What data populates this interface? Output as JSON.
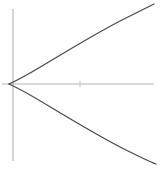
{
  "figure": {
    "title": "",
    "background_color": "#fefefe",
    "width": 160,
    "height": 172
  },
  "axes": {
    "axis_color": "#b3b3b3",
    "tick_color": "#c2c2c2",
    "x_axis": {
      "name": "x-axis",
      "y_pixel": 84,
      "x_start_pixel": 2,
      "x_end_pixel": 154,
      "label": ""
    },
    "y_axis": {
      "name": "y-axis",
      "x_pixel": 13,
      "y_start_pixel": 9,
      "y_end_pixel": 161,
      "label": ""
    },
    "ticks": [
      {
        "name": "x-tick-1",
        "x_pixel": 80,
        "y_pixel": 84,
        "label": ""
      }
    ]
  },
  "curve": {
    "name": "parabola",
    "color": "#4a4a4a",
    "stroke_width": 1.25,
    "orientation": "opens-right",
    "vertex_pixel": {
      "x": 9,
      "y": 84
    },
    "upper_branch_path": "M 9 84 C 18 80 34 71 52 60 C 74 47 100 31 124 19 C 138 12 148 7 154 4",
    "lower_branch_path": "M 9 84 C 18 88 34 97 52 108 C 74 121 100 137 124 149 C 138 156 148 161 156 164"
  },
  "chart_data": {
    "type": "line",
    "title": "",
    "xlabel": "",
    "ylabel": "",
    "grid": false,
    "legend": "none",
    "xlim": [
      -0.2,
      3.0
    ],
    "ylim": [
      -1.6,
      1.6
    ],
    "series": [
      {
        "name": "upper branch",
        "x": [
          0.0,
          0.2,
          0.5,
          0.9,
          1.4,
          2.0,
          2.6,
          3.0
        ],
        "y": [
          0.0,
          0.26,
          0.46,
          0.66,
          0.9,
          1.16,
          1.42,
          1.6
        ]
      },
      {
        "name": "lower branch",
        "x": [
          0.0,
          0.2,
          0.5,
          0.9,
          1.4,
          2.0,
          2.6,
          3.0
        ],
        "y": [
          0.0,
          -0.26,
          -0.46,
          -0.66,
          -0.9,
          -1.16,
          -1.42,
          -1.6
        ]
      }
    ]
  }
}
